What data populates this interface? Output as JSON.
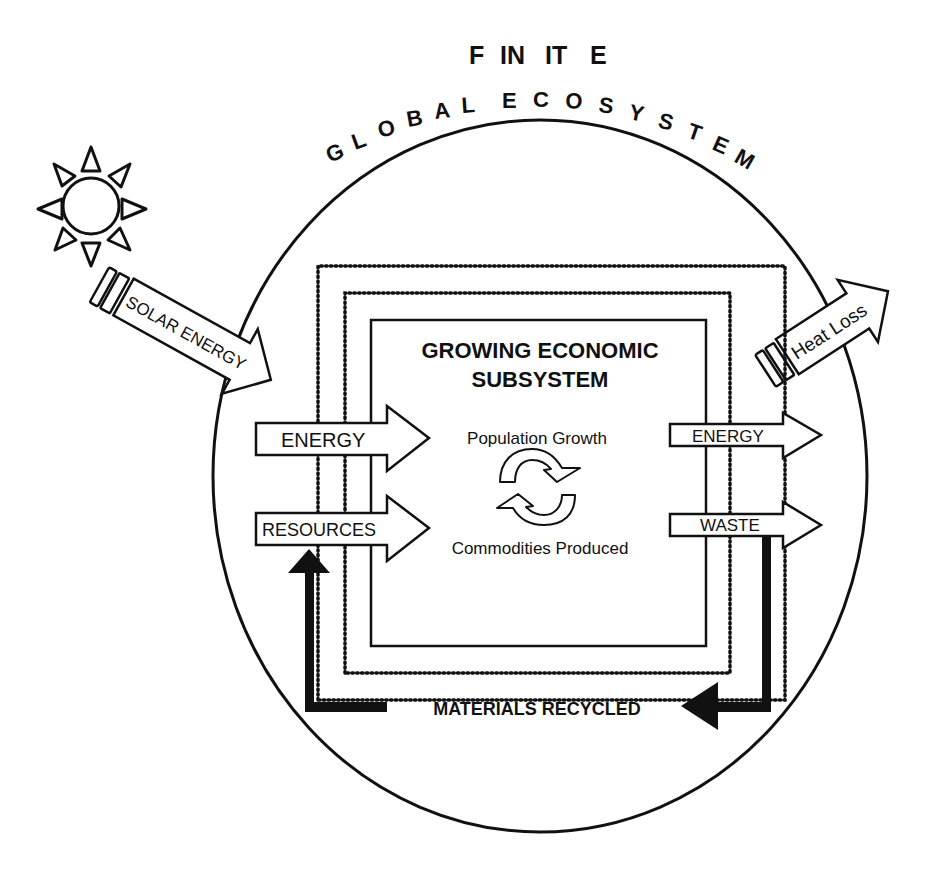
{
  "title": {
    "line1": "FINITE",
    "line1_letters": [
      "F",
      "IN",
      "IT",
      "E"
    ],
    "line2": "GLOBAL ECOSYSTEM",
    "line2_letters": [
      "G",
      "L",
      "O",
      "B",
      "A",
      "L",
      "E",
      "C",
      "O",
      "S",
      "Y",
      "S",
      "T",
      "E",
      "M"
    ]
  },
  "inputs": {
    "solar": "SOLAR ENERGY",
    "energy_in": "ENERGY",
    "resources_in": "RESOURCES"
  },
  "outputs": {
    "heat": "Heat Loss",
    "energy_out": "ENERGY",
    "waste_out": "WASTE"
  },
  "subsystem": {
    "title_line1": "GROWING ECONOMIC",
    "title_line2": "SUBSYSTEM",
    "cycle_top": "Population Growth",
    "cycle_bottom": "Commodities Produced"
  },
  "recycle": {
    "label": "MATERIALS RECYCLED"
  },
  "colors": {
    "ink": "#111111",
    "background": "#ffffff"
  }
}
